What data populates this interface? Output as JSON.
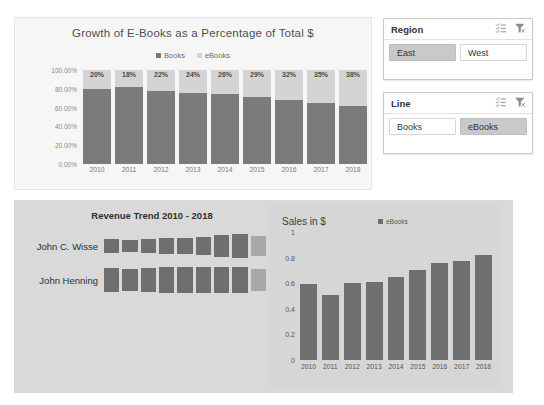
{
  "top_chart": {
    "title": "Growth of E-Books as a Percentage of Total $",
    "legend": [
      {
        "label": "Books",
        "color": "#7b7b7b"
      },
      {
        "label": "eBooks",
        "color": "#d4d4d4"
      }
    ]
  },
  "slicers": [
    {
      "name": "Region",
      "title": "Region",
      "multiselect_icon": "multi-select-icon",
      "clear_icon": "clear-filter-icon",
      "items": [
        {
          "label": "East",
          "selected": true
        },
        {
          "label": "West",
          "selected": false
        }
      ]
    },
    {
      "name": "Line",
      "title": "Line",
      "multiselect_icon": "multi-select-icon",
      "clear_icon": "clear-filter-icon",
      "items": [
        {
          "label": "Books",
          "selected": false
        },
        {
          "label": "eBooks",
          "selected": true
        }
      ]
    }
  ],
  "revenue_trend": {
    "title": "Revenue Trend 2010 - 2018",
    "rows": [
      {
        "label": "John C. Wisse"
      },
      {
        "label": "John Henning"
      }
    ]
  },
  "sales_chart": {
    "title": "Sales in $",
    "legend_label": "eBooks"
  },
  "colors": {
    "books_series": "#7b7b7b",
    "ebooks_series": "#d4d4d4",
    "bar_dark": "#6f6f6f",
    "bar_light": "#a8a8a8",
    "panel_bg": "#d9d9d9",
    "chart_bg": "#f6f6f6",
    "slicer_selected": "#c9c9c9"
  },
  "chart_data": [
    {
      "type": "bar",
      "name": "growth-of-ebooks-stacked",
      "stacked": true,
      "title": "Growth of E-Books as a Percentage of Total $",
      "xlabel": "",
      "ylabel": "",
      "grid": false,
      "legend_position": "top",
      "ylim": [
        0,
        1
      ],
      "yticks": [
        "0.00%",
        "20.00%",
        "40.00%",
        "60.00%",
        "80.00%",
        "100.00%"
      ],
      "categories": [
        "2010",
        "2011",
        "2012",
        "2013",
        "2014",
        "2015",
        "2016",
        "2017",
        "2018"
      ],
      "series": [
        {
          "name": "Books",
          "values": [
            0.8,
            0.82,
            0.78,
            0.76,
            0.74,
            0.71,
            0.68,
            0.65,
            0.62
          ]
        },
        {
          "name": "eBooks",
          "values": [
            0.2,
            0.18,
            0.22,
            0.24,
            0.26,
            0.29,
            0.32,
            0.35,
            0.38
          ]
        }
      ],
      "data_labels": [
        "20%",
        "18%",
        "22%",
        "24%",
        "26%",
        "29%",
        "32%",
        "35%",
        "38%"
      ]
    },
    {
      "type": "bar",
      "name": "revenue-trend-sparkbars",
      "title": "Revenue Trend 2010 - 2018",
      "orientation": "vertical",
      "grid": false,
      "legend_position": "none",
      "categories": [
        "2010",
        "2011",
        "2012",
        "2013",
        "2014",
        "2015",
        "2016",
        "2017",
        "2018"
      ],
      "series": [
        {
          "name": "John C. Wisse",
          "values": [
            0.52,
            0.44,
            0.55,
            0.62,
            0.64,
            0.72,
            0.88,
            0.92,
            0.8
          ]
        },
        {
          "name": "John Henning",
          "values": [
            0.88,
            0.8,
            0.88,
            0.9,
            0.9,
            0.92,
            0.93,
            0.95,
            0.78
          ]
        }
      ],
      "last_bar_highlighted": true
    },
    {
      "type": "bar",
      "name": "sales-in-dollars",
      "title": "Sales in $",
      "xlabel": "",
      "ylabel": "",
      "grid": false,
      "legend_position": "top-right",
      "ylim": [
        0,
        1
      ],
      "yticks": [
        "0",
        "0.2",
        "0.4",
        "0.6",
        "0.8",
        "1"
      ],
      "categories": [
        "2010",
        "2011",
        "2012",
        "2013",
        "2014",
        "2015",
        "2016",
        "2017",
        "2018"
      ],
      "series": [
        {
          "name": "eBooks",
          "values": [
            0.59,
            0.51,
            0.6,
            0.61,
            0.65,
            0.7,
            0.76,
            0.77,
            0.82
          ]
        }
      ]
    }
  ]
}
